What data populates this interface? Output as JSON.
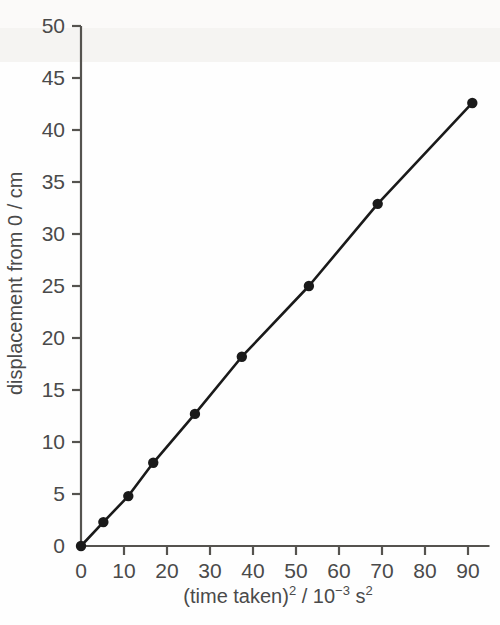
{
  "chart_data": {
    "type": "line",
    "title": "",
    "xlabel": "(time taken)2 / 10-3 s2",
    "xlabel_parts": {
      "lead": "(time taken)",
      "exp1": "2",
      "mid": " / 10",
      "exp2": "−3",
      "tail": " s",
      "exp3": "2"
    },
    "ylabel": "displacement from 0 / cm",
    "xlim": [
      0,
      95
    ],
    "ylim": [
      0,
      51
    ],
    "xticks": [
      0,
      10,
      20,
      30,
      40,
      50,
      60,
      70,
      80,
      90
    ],
    "yticks": [
      0,
      5,
      10,
      15,
      20,
      25,
      30,
      35,
      40,
      45,
      50
    ],
    "xtick_labels": [
      "0",
      "10",
      "20",
      "30",
      "40",
      "50",
      "60",
      "70",
      "80",
      "90"
    ],
    "ytick_labels": [
      "0",
      "5",
      "10",
      "15",
      "20",
      "25",
      "30",
      "35",
      "40",
      "45",
      "50"
    ],
    "grid": false,
    "legend": false,
    "legend_position": "none",
    "marker": "filled-circle",
    "line_color": "#1a1a1a",
    "marker_color": "#1a1a1a",
    "axis_color": "#55534f",
    "background_color": "#fefefe",
    "series": [
      {
        "name": "displacement vs (time taken) squared",
        "x": [
          0,
          5.2,
          11.0,
          16.8,
          26.5,
          37.4,
          53.0,
          69.0,
          91.0
        ],
        "values": [
          0.0,
          2.3,
          4.8,
          8.0,
          12.7,
          18.2,
          25.0,
          32.9,
          42.6
        ]
      }
    ]
  }
}
